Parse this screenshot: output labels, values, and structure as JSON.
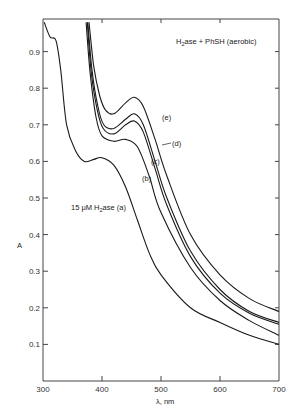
{
  "chart_data": {
    "type": "line",
    "title": "H2ase + PhSH (aerobic)",
    "xlabel": "λ, nm",
    "ylabel": "A",
    "xlim": [
      300,
      700
    ],
    "ylim": [
      0,
      0.98
    ],
    "xticks": [
      300,
      400,
      500,
      600,
      700
    ],
    "xtick_labels": [
      "300",
      "400",
      "500",
      "600",
      "700"
    ],
    "yticks": [
      0.1,
      0.2,
      0.3,
      0.4,
      0.5,
      0.6,
      0.7,
      0.8,
      0.9
    ],
    "ytick_labels": [
      "0.1",
      "0.2",
      "0.3",
      "0.4",
      "0.5",
      "0.6",
      "0.7",
      "0.8",
      "0.9"
    ],
    "grid": false,
    "annotations": [
      "H2ase + PhSH (aerobic)",
      "15 μM H2ase (a)",
      "(b)",
      "(c)",
      "(d)",
      "(e)"
    ],
    "series": [
      {
        "name": "(a) 15 μM H2ase",
        "x": [
          302,
          312,
          322,
          330,
          340,
          355,
          370,
          385,
          400,
          420,
          440,
          460,
          480,
          500,
          550,
          600,
          650,
          700
        ],
        "y": [
          0.98,
          0.94,
          0.93,
          0.85,
          0.7,
          0.63,
          0.6,
          0.605,
          0.61,
          0.59,
          0.53,
          0.44,
          0.35,
          0.29,
          0.2,
          0.16,
          0.125,
          0.1
        ]
      },
      {
        "name": "(b)",
        "x": [
          373,
          380,
          390,
          400,
          420,
          440,
          460,
          480,
          500,
          550,
          600,
          650,
          700
        ],
        "y": [
          0.98,
          0.84,
          0.72,
          0.67,
          0.655,
          0.66,
          0.64,
          0.56,
          0.46,
          0.31,
          0.22,
          0.165,
          0.125
        ]
      },
      {
        "name": "(c)",
        "x": [
          375,
          382,
          392,
          402,
          420,
          440,
          455,
          470,
          490,
          510,
          550,
          600,
          650,
          700
        ],
        "y": [
          0.98,
          0.84,
          0.74,
          0.69,
          0.675,
          0.7,
          0.71,
          0.68,
          0.58,
          0.48,
          0.34,
          0.24,
          0.185,
          0.155
        ]
      },
      {
        "name": "(d)",
        "x": [
          376,
          383,
          393,
          403,
          420,
          440,
          455,
          470,
          490,
          510,
          550,
          600,
          650,
          700
        ],
        "y": [
          0.98,
          0.85,
          0.75,
          0.7,
          0.69,
          0.715,
          0.73,
          0.7,
          0.6,
          0.5,
          0.355,
          0.25,
          0.19,
          0.16
        ]
      },
      {
        "name": "(e)",
        "x": [
          378,
          386,
          396,
          406,
          420,
          440,
          455,
          470,
          490,
          510,
          550,
          600,
          650,
          700
        ],
        "y": [
          0.98,
          0.86,
          0.78,
          0.74,
          0.73,
          0.76,
          0.775,
          0.75,
          0.66,
          0.56,
          0.4,
          0.29,
          0.225,
          0.19
        ]
      }
    ]
  },
  "labels": {
    "title_h": "H",
    "title_sub": "2",
    "title_rest": "ase  + PhSH  (aerobic)",
    "conc_prefix": "15 μM  H",
    "conc_sub": "2",
    "conc_rest": "ase  (a)",
    "b": "(b)",
    "c": "(c)",
    "d": "(d)",
    "e": "(e)",
    "ylabel": "A",
    "xlabel": "λ, nm"
  }
}
